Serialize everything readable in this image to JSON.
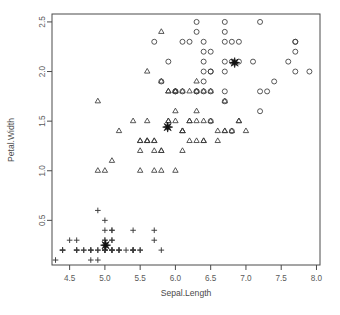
{
  "chart_data": {
    "type": "scatter",
    "title": "",
    "xlabel": "Sepal.Length",
    "ylabel": "Petal.Width",
    "xlim": [
      4.25,
      8.05
    ],
    "ylim": [
      0.05,
      2.58
    ],
    "xticks": [
      4.5,
      5.0,
      5.5,
      6.0,
      6.5,
      7.0,
      7.5,
      8.0
    ],
    "xticklabels": [
      "4.5",
      "5.0",
      "5.5",
      "6.0",
      "6.5",
      "7.0",
      "7.5",
      "8.0"
    ],
    "yticks": [
      0.5,
      1.0,
      1.5,
      2.0,
      2.5
    ],
    "yticklabels": [
      "0.5",
      "1.0",
      "1.5",
      "2.0",
      "2.5"
    ],
    "grid": false,
    "legend": "none",
    "box": true,
    "marker_color": "#3a3a3a",
    "centroid_color": "#111111",
    "series": [
      {
        "name": "cluster-plus",
        "marker": "plus",
        "points": [
          [
            4.3,
            0.1
          ],
          [
            4.4,
            0.2
          ],
          [
            4.4,
            0.2
          ],
          [
            4.4,
            0.2
          ],
          [
            4.5,
            0.3
          ],
          [
            4.6,
            0.2
          ],
          [
            4.6,
            0.2
          ],
          [
            4.6,
            0.3
          ],
          [
            4.6,
            0.2
          ],
          [
            4.7,
            0.2
          ],
          [
            4.7,
            0.2
          ],
          [
            4.8,
            0.2
          ],
          [
            4.8,
            0.1
          ],
          [
            4.8,
            0.2
          ],
          [
            4.8,
            0.2
          ],
          [
            4.9,
            0.2
          ],
          [
            4.9,
            0.1
          ],
          [
            4.9,
            0.2
          ],
          [
            4.9,
            0.6
          ],
          [
            5.0,
            0.2
          ],
          [
            5.0,
            0.2
          ],
          [
            5.0,
            0.4
          ],
          [
            5.0,
            0.2
          ],
          [
            5.0,
            0.2
          ],
          [
            5.0,
            0.3
          ],
          [
            5.0,
            0.2
          ],
          [
            5.0,
            0.5
          ],
          [
            5.0,
            0.3
          ],
          [
            5.1,
            0.4
          ],
          [
            5.1,
            0.3
          ],
          [
            5.1,
            0.2
          ],
          [
            5.1,
            0.2
          ],
          [
            5.1,
            0.4
          ],
          [
            5.1,
            0.3
          ],
          [
            5.1,
            0.2
          ],
          [
            5.1,
            0.2
          ],
          [
            5.2,
            0.2
          ],
          [
            5.2,
            0.2
          ],
          [
            5.2,
            0.2
          ],
          [
            5.3,
            0.2
          ],
          [
            5.4,
            0.2
          ],
          [
            5.4,
            0.4
          ],
          [
            5.4,
            0.2
          ],
          [
            5.4,
            0.2
          ],
          [
            5.4,
            0.2
          ],
          [
            5.5,
            0.2
          ],
          [
            5.5,
            0.2
          ],
          [
            5.7,
            0.3
          ],
          [
            5.7,
            0.4
          ],
          [
            5.8,
            0.2
          ]
        ]
      },
      {
        "name": "cluster-triangle",
        "marker": "triangle",
        "points": [
          [
            4.9,
            1.0
          ],
          [
            5.0,
            1.0
          ],
          [
            5.1,
            1.1
          ],
          [
            5.2,
            1.4
          ],
          [
            5.4,
            1.5
          ],
          [
            5.5,
            1.0
          ],
          [
            5.5,
            1.3
          ],
          [
            5.5,
            1.3
          ],
          [
            5.5,
            1.2
          ],
          [
            5.6,
            1.3
          ],
          [
            5.6,
            1.3
          ],
          [
            5.6,
            1.5
          ],
          [
            5.6,
            1.3
          ],
          [
            5.6,
            2.0
          ],
          [
            5.7,
            1.0
          ],
          [
            5.7,
            1.2
          ],
          [
            5.7,
            1.3
          ],
          [
            5.7,
            1.3
          ],
          [
            5.8,
            1.2
          ],
          [
            5.8,
            1.0
          ],
          [
            5.8,
            1.2
          ],
          [
            5.8,
            1.9
          ],
          [
            5.8,
            2.4
          ],
          [
            5.9,
            1.5
          ],
          [
            5.9,
            1.5
          ],
          [
            5.9,
            1.8
          ],
          [
            5.9,
            1.8
          ],
          [
            6.0,
            1.0
          ],
          [
            6.0,
            1.6
          ],
          [
            6.0,
            1.5
          ],
          [
            6.0,
            1.8
          ],
          [
            6.0,
            1.8
          ],
          [
            6.1,
            1.4
          ],
          [
            6.1,
            1.4
          ],
          [
            6.1,
            1.2
          ],
          [
            6.1,
            1.4
          ],
          [
            6.1,
            1.8
          ],
          [
            6.2,
            1.5
          ],
          [
            6.2,
            1.5
          ],
          [
            6.2,
            1.8
          ],
          [
            6.2,
            1.3
          ],
          [
            6.3,
            1.5
          ],
          [
            6.3,
            1.6
          ],
          [
            6.3,
            1.3
          ],
          [
            6.3,
            1.8
          ],
          [
            6.3,
            1.9
          ],
          [
            6.4,
            1.5
          ],
          [
            6.4,
            1.3
          ],
          [
            6.4,
            1.8
          ],
          [
            6.4,
            1.3
          ],
          [
            6.5,
            1.5
          ],
          [
            6.5,
            1.8
          ],
          [
            6.6,
            1.3
          ],
          [
            6.6,
            1.4
          ],
          [
            6.7,
            1.4
          ],
          [
            6.7,
            1.4
          ],
          [
            6.7,
            1.7
          ],
          [
            6.8,
            1.4
          ],
          [
            6.9,
            1.5
          ],
          [
            6.9,
            1.5
          ],
          [
            7.0,
            1.4
          ],
          [
            4.9,
            1.7
          ]
        ]
      },
      {
        "name": "cluster-circle",
        "marker": "circle",
        "points": [
          [
            5.8,
            1.9
          ],
          [
            5.9,
            2.1
          ],
          [
            6.0,
            1.8
          ],
          [
            6.1,
            2.3
          ],
          [
            6.2,
            2.3
          ],
          [
            6.3,
            1.8
          ],
          [
            6.3,
            2.5
          ],
          [
            6.3,
            2.4
          ],
          [
            6.3,
            1.8
          ],
          [
            6.4,
            2.2
          ],
          [
            6.4,
            2.3
          ],
          [
            6.4,
            2.1
          ],
          [
            6.4,
            1.9
          ],
          [
            6.4,
            2.0
          ],
          [
            6.5,
            2.2
          ],
          [
            6.5,
            2.0
          ],
          [
            6.5,
            1.8
          ],
          [
            6.5,
            2.0
          ],
          [
            6.7,
            2.5
          ],
          [
            6.7,
            2.4
          ],
          [
            6.7,
            2.3
          ],
          [
            6.7,
            2.1
          ],
          [
            6.7,
            1.8
          ],
          [
            6.7,
            2.0
          ],
          [
            6.7,
            1.7
          ],
          [
            6.8,
            2.1
          ],
          [
            6.8,
            2.3
          ],
          [
            6.8,
            1.4
          ],
          [
            6.9,
            2.3
          ],
          [
            6.9,
            2.1
          ],
          [
            7.1,
            2.1
          ],
          [
            7.2,
            2.5
          ],
          [
            7.2,
            1.8
          ],
          [
            7.2,
            1.6
          ],
          [
            7.3,
            1.8
          ],
          [
            7.4,
            1.9
          ],
          [
            7.6,
            2.1
          ],
          [
            7.7,
            2.3
          ],
          [
            7.7,
            2.2
          ],
          [
            7.7,
            2.0
          ],
          [
            7.7,
            2.3
          ],
          [
            7.9,
            2.0
          ],
          [
            6.0,
            1.8
          ],
          [
            6.1,
            1.8
          ],
          [
            6.5,
            1.5
          ],
          [
            6.4,
            1.8
          ],
          [
            5.7,
            2.3
          ]
        ]
      }
    ],
    "centroids": [
      {
        "name": "centroid-cluster-plus",
        "x": 5.01,
        "y": 0.25,
        "marker": "star"
      },
      {
        "name": "centroid-cluster-triangle",
        "x": 5.89,
        "y": 1.44,
        "marker": "star"
      },
      {
        "name": "centroid-cluster-circle",
        "x": 6.84,
        "y": 2.09,
        "marker": "star"
      }
    ]
  }
}
